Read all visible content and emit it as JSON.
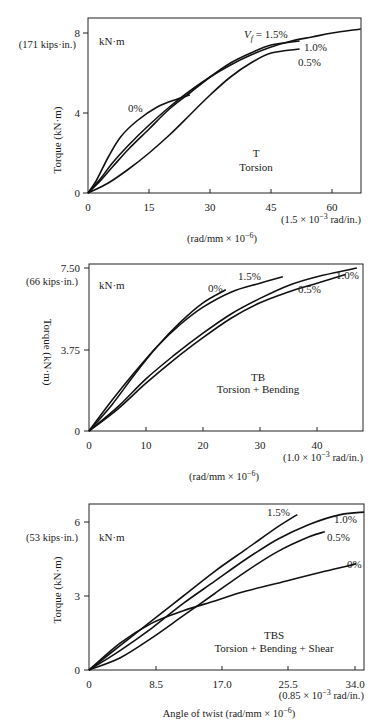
{
  "chart_data": [
    {
      "type": "line",
      "title": "T",
      "subtitle": "Torsion",
      "unit_label": "kN·m",
      "ylabel": "Torque (kN·m)",
      "xlabel": "(rad/mm × 10^-6)",
      "x_secondary_label": "(1.5 × 10^-3 rad/in.)",
      "y_secondary_label": "(171 kips·in.)",
      "xticks": [
        "0",
        "15",
        "30",
        "45",
        "60"
      ],
      "yticks": [
        "0",
        "4",
        "8"
      ],
      "xlim": [
        0,
        67
      ],
      "ylim": [
        0,
        8.8
      ],
      "legend_prefix": "Vf = ",
      "series": [
        {
          "name": "0%",
          "x": [
            0,
            2,
            5,
            8,
            12,
            17,
            22,
            25
          ],
          "y": [
            0,
            0.6,
            1.8,
            2.8,
            3.6,
            4.3,
            4.7,
            4.9
          ]
        },
        {
          "name": "0.5%",
          "x": [
            0,
            5,
            10,
            15,
            20,
            25,
            30,
            35,
            40,
            45,
            52
          ],
          "y": [
            0,
            0.5,
            1.2,
            2.0,
            2.9,
            3.9,
            4.9,
            5.8,
            6.5,
            7.0,
            7.2
          ]
        },
        {
          "name": "1.0%",
          "x": [
            0,
            3,
            6,
            10,
            15,
            20,
            25,
            30,
            35,
            40,
            45,
            52
          ],
          "y": [
            0,
            0.6,
            1.3,
            2.2,
            3.2,
            4.2,
            5.0,
            5.8,
            6.5,
            7.0,
            7.4,
            7.6
          ]
        },
        {
          "name": "1.5%",
          "x": [
            0,
            3,
            6,
            10,
            15,
            20,
            25,
            30,
            35,
            40,
            45,
            50,
            55,
            60,
            67
          ],
          "y": [
            0,
            0.7,
            1.5,
            2.4,
            3.4,
            4.3,
            5.1,
            5.8,
            6.4,
            6.9,
            7.3,
            7.6,
            7.8,
            8.0,
            8.2
          ]
        }
      ]
    },
    {
      "type": "line",
      "title": "TB",
      "subtitle": "Torsion + Bending",
      "unit_label": "kN·m",
      "ylabel": "Torque (kN·m)",
      "xlabel": "(rad/mm × 10^-6)",
      "x_secondary_label": "(1.0 × 10^-3 rad/in.)",
      "y_secondary_label": "(66 kips·in.)",
      "xticks": [
        "0",
        "10",
        "20",
        "30",
        "40"
      ],
      "yticks": [
        "0",
        "3.75",
        "7.50"
      ],
      "xlim": [
        0,
        48
      ],
      "ylim": [
        0,
        7.65
      ],
      "series": [
        {
          "name": "0%",
          "x": [
            0,
            4,
            8,
            12,
            16,
            20,
            24
          ],
          "y": [
            0,
            1.2,
            2.6,
            3.9,
            5.0,
            5.9,
            6.5
          ]
        },
        {
          "name": "0.5%",
          "x": [
            0,
            5,
            10,
            15,
            20,
            25,
            30,
            35,
            40,
            45
          ],
          "y": [
            0,
            1.0,
            2.2,
            3.3,
            4.3,
            5.2,
            5.9,
            6.4,
            6.8,
            7.2
          ]
        },
        {
          "name": "1.0%",
          "x": [
            0,
            5,
            10,
            15,
            20,
            25,
            30,
            35,
            40,
            47
          ],
          "y": [
            0,
            1.1,
            2.4,
            3.5,
            4.5,
            5.4,
            6.1,
            6.7,
            7.1,
            7.5
          ]
        },
        {
          "name": "1.5%",
          "x": [
            0,
            4,
            8,
            12,
            16,
            20,
            25,
            30,
            34
          ],
          "y": [
            0,
            1.4,
            2.7,
            3.9,
            4.9,
            5.7,
            6.4,
            6.8,
            7.1
          ]
        }
      ]
    },
    {
      "type": "line",
      "title": "TBS",
      "subtitle": "Torsion + Bending + Shear",
      "unit_label": "kN·m",
      "ylabel": "Torque (kN·m)",
      "xlabel": "Angle of twist (rad/mm × 10^-6)",
      "x_secondary_label": "(0.85 × 10^-3 rad/in.)",
      "y_secondary_label": "(53 kips·in.)",
      "xticks": [
        "0",
        "8.5",
        "17.0",
        "25.5",
        "34.0"
      ],
      "yticks": [
        "0",
        "3",
        "6"
      ],
      "xlim": [
        0,
        35
      ],
      "ylim": [
        0,
        6.7
      ],
      "series": [
        {
          "name": "0%",
          "x": [
            0,
            4,
            8,
            12,
            16,
            20,
            25,
            30,
            34
          ],
          "y": [
            0,
            1.1,
            1.9,
            2.4,
            2.8,
            3.2,
            3.6,
            4.0,
            4.3
          ]
        },
        {
          "name": "0.5%",
          "x": [
            0,
            4,
            8,
            12,
            16,
            20,
            24,
            28,
            30
          ],
          "y": [
            0,
            0.5,
            1.3,
            2.2,
            3.1,
            4.0,
            4.8,
            5.4,
            5.6
          ]
        },
        {
          "name": "1.0%",
          "x": [
            0,
            4,
            8,
            12,
            16,
            20,
            24,
            28,
            32,
            35
          ],
          "y": [
            0,
            0.8,
            1.7,
            2.7,
            3.6,
            4.5,
            5.3,
            5.9,
            6.3,
            6.4
          ]
        },
        {
          "name": "1.5%",
          "x": [
            0,
            4,
            8,
            12,
            16,
            20,
            24,
            26.5
          ],
          "y": [
            0,
            1.0,
            2.0,
            3.0,
            4.0,
            4.9,
            5.8,
            6.3
          ]
        }
      ]
    }
  ],
  "labels": {
    "c1_unit": "kN·m",
    "c1_kips": "(171 kips·in.)",
    "c1_yaxis": "Torque (kN·m)",
    "c1_y8": "8",
    "c1_y4": "4",
    "c1_y0": "0",
    "c1_x0": "0",
    "c1_x15": "15",
    "c1_x30": "30",
    "c1_x45": "45",
    "c1_x60": "60",
    "c1_xsec": "(1.5 × 10",
    "c1_xsec_exp": "−3",
    "c1_xsec_tail": " rad/in.)",
    "c1_xunit": "(rad/mm × 10",
    "c1_xunit_exp": "−6",
    "c1_xunit_tail": ")",
    "c1_title": "T",
    "c1_subtitle": "Torsion",
    "c1_vf": "V",
    "c1_vf_sub": "f",
    "c1_vf_tail": " = 1.5%",
    "c1_l10": "1.0%",
    "c1_l05": "0.5%",
    "c1_l0": "0%",
    "c2_unit": "kN·m",
    "c2_kips": "(66 kips·in.)",
    "c2_yaxis": "Torque (kN·m)",
    "c2_y750": "7.50",
    "c2_y375": "3.75",
    "c2_y0": "0",
    "c2_x0": "0",
    "c2_x10": "10",
    "c2_x20": "20",
    "c2_x30": "30",
    "c2_x40": "40",
    "c2_xsec": "(1.0 × 10",
    "c2_xsec_exp": "−3",
    "c2_xsec_tail": " rad/in.)",
    "c2_xunit": "(rad/mm × 10",
    "c2_xunit_exp": "−6",
    "c2_xunit_tail": ")",
    "c2_title": "TB",
    "c2_subtitle": "Torsion + Bending",
    "c2_l15": "1.5%",
    "c2_l0": "0%",
    "c2_l10": "1.0%",
    "c2_l05": "0.5%",
    "c3_unit": "kN·m",
    "c3_kips": "(53 kips·in.)",
    "c3_yaxis": "Torque (kN·m)",
    "c3_y6": "6",
    "c3_y3": "3",
    "c3_y0": "0",
    "c3_x0": "0",
    "c3_x85": "8.5",
    "c3_x170": "17.0",
    "c3_x255": "25.5",
    "c3_x340": "34.0",
    "c3_xsec": "(0.85 × 10",
    "c3_xsec_exp": "−3",
    "c3_xsec_tail": " rad/in.)",
    "c3_xunit": "Angle of twist (rad/mm × 10",
    "c3_xunit_exp": "−6",
    "c3_xunit_tail": ")",
    "c3_title": "TBS",
    "c3_subtitle": "Torsion + Bending + Shear",
    "c3_l15": "1.5%",
    "c3_l10": "1.0%",
    "c3_l05": "0.5%",
    "c3_l0": "0%"
  }
}
